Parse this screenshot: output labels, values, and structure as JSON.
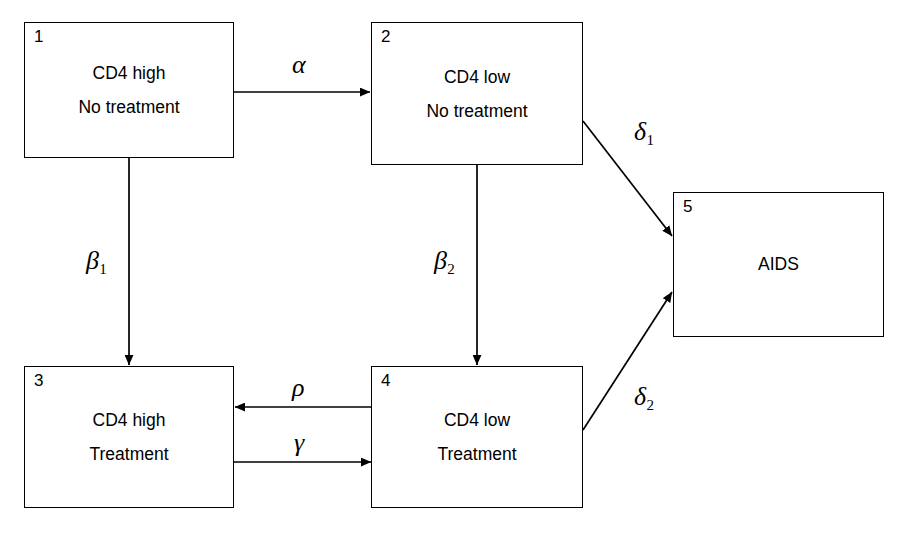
{
  "diagram": {
    "type": "state-transition-diagram",
    "width": 904,
    "height": 533,
    "background_color": "#ffffff",
    "stroke_color": "#000000",
    "states": [
      {
        "id": 1,
        "number": "1",
        "lines": [
          "CD4 high",
          "No treatment"
        ],
        "x": 24,
        "y": 22,
        "w": 210,
        "h": 136
      },
      {
        "id": 2,
        "number": "2",
        "lines": [
          "CD4 low",
          "No treatment"
        ],
        "x": 371,
        "y": 22,
        "w": 212,
        "h": 143
      },
      {
        "id": 3,
        "number": "3",
        "lines": [
          "CD4 high",
          "Treatment"
        ],
        "x": 24,
        "y": 366,
        "w": 210,
        "h": 142
      },
      {
        "id": 4,
        "number": "4",
        "lines": [
          "CD4 low",
          "Treatment"
        ],
        "x": 371,
        "y": 366,
        "w": 212,
        "h": 142
      },
      {
        "id": 5,
        "number": "5",
        "lines": [
          "AIDS"
        ],
        "x": 673,
        "y": 192,
        "w": 211,
        "h": 145
      }
    ],
    "transitions": [
      {
        "name": "alpha",
        "symbol": "α",
        "subscript": "",
        "from": 1,
        "to": 2,
        "label_x": 292,
        "label_y": 52
      },
      {
        "name": "beta-1",
        "symbol": "β",
        "subscript": "1",
        "from": 1,
        "to": 3,
        "label_x": 86,
        "label_y": 248
      },
      {
        "name": "beta-2",
        "symbol": "β",
        "subscript": "2",
        "from": 2,
        "to": 4,
        "label_x": 434,
        "label_y": 248
      },
      {
        "name": "delta-1",
        "symbol": "δ",
        "subscript": "1",
        "from": 2,
        "to": 5,
        "label_x": 634,
        "label_y": 119
      },
      {
        "name": "delta-2",
        "symbol": "δ",
        "subscript": "2",
        "from": 4,
        "to": 5,
        "label_x": 634,
        "label_y": 384
      },
      {
        "name": "rho",
        "symbol": "ρ",
        "subscript": "",
        "from": 4,
        "to": 3,
        "label_x": 292,
        "label_y": 375
      },
      {
        "name": "gamma",
        "symbol": "γ",
        "subscript": "",
        "from": 3,
        "to": 4,
        "label_x": 294,
        "label_y": 430
      }
    ]
  }
}
